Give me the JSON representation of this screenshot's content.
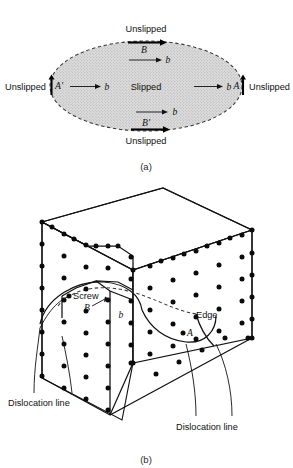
{
  "figure": {
    "panels": [
      {
        "id": "a",
        "caption": "(a)",
        "type": "dislocation-loop-plan-view",
        "region_labels": {
          "interior": "Slipped",
          "top": "Unslipped",
          "bottom": "Unslipped",
          "left": "Unslipped",
          "right": "Unslipped"
        },
        "segment_labels": {
          "top": "B",
          "bottom": "B'",
          "left": "A'",
          "right": "A"
        },
        "burgers_labels": [
          "b",
          "b",
          "b",
          "b"
        ],
        "boundary_style": "dashed ellipse",
        "fill_style": "stippled gray",
        "fill_color": "#d7d7d7"
      },
      {
        "id": "b",
        "caption": "(b)",
        "type": "crystal-block-dislocation-loop",
        "labels": {
          "screw": "Screw",
          "edge": "Edge",
          "point_b": "B",
          "point_a": "A",
          "burgers": "b",
          "dislocation_line_left": "Dislocation line",
          "dislocation_line_right": "Dislocation line"
        },
        "lattice": {
          "dot_color": "#0b0b0b",
          "description": "atom dot lattice on front-left and front-right faces"
        }
      }
    ]
  }
}
